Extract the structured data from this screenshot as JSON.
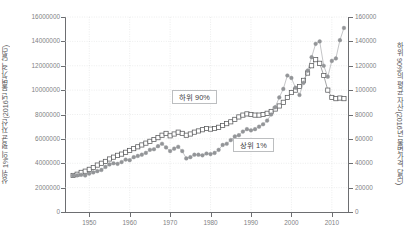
{
  "axes": {
    "left_title": "상위 1%의 평균 자산(2016년 불변가격 달러)",
    "right_title": "하위 90%의 평균 자산(2016년 불변가격 달러)",
    "x_title": "",
    "left_ticks": [
      "16000000",
      "14000000",
      "12000000",
      "10000000",
      "8000000",
      "6000000",
      "4000000",
      "2000000",
      "0"
    ],
    "right_ticks": [
      "160000",
      "140000",
      "120000",
      "100000",
      "80000",
      "60000",
      "40000",
      "20000",
      "0"
    ],
    "x_ticks": [
      "1950",
      "1960",
      "1970",
      "1980",
      "1990",
      "2000",
      "2010"
    ]
  },
  "labels": {
    "bottom90": "하위 90%",
    "top1": "상위 1%"
  },
  "colors": {
    "axis": "#6d6e71",
    "grid": "#d9dadb",
    "series_bottom90": "#58595b",
    "series_top1": "#939598",
    "text": "#808184",
    "title_text": "#58585a",
    "label_border": "#bcbec0",
    "background": "#ffffff"
  },
  "chart_data": {
    "type": "line",
    "title": "",
    "xlabel": "",
    "ylabel": "상위 1%의 평균 자산(2016년 불변가격 달러)",
    "y2label": "하위 90%의 평균 자산(2016년 불변가격 달러)",
    "xlim": [
      1944,
      2014
    ],
    "ylim": [
      0,
      16000000
    ],
    "y2lim": [
      0,
      160000
    ],
    "grid": true,
    "legend_position": "inside-plot",
    "x": [
      1946,
      1947,
      1948,
      1949,
      1950,
      1951,
      1952,
      1953,
      1954,
      1955,
      1956,
      1957,
      1958,
      1959,
      1960,
      1961,
      1962,
      1963,
      1964,
      1965,
      1966,
      1967,
      1968,
      1969,
      1970,
      1971,
      1972,
      1973,
      1974,
      1975,
      1976,
      1977,
      1978,
      1979,
      1980,
      1981,
      1982,
      1983,
      1984,
      1985,
      1986,
      1987,
      1988,
      1989,
      1990,
      1991,
      1992,
      1993,
      1994,
      1995,
      1996,
      1997,
      1998,
      1999,
      2000,
      2001,
      2002,
      2003,
      2004,
      2005,
      2006,
      2007,
      2008,
      2009,
      2010,
      2011,
      2012,
      2013
    ],
    "series": [
      {
        "name": "하위 90%",
        "axis": "right",
        "marker": "open-square",
        "values": [
          30000,
          31000,
          32500,
          33500,
          35000,
          36500,
          38500,
          40000,
          41500,
          43500,
          45000,
          46500,
          47500,
          49000,
          50500,
          52000,
          53500,
          55000,
          56500,
          58000,
          59500,
          61000,
          63000,
          64500,
          62500,
          64000,
          65500,
          64500,
          63000,
          64000,
          65500,
          66500,
          67500,
          68500,
          68000,
          68500,
          69500,
          71000,
          72500,
          74000,
          76000,
          78000,
          79500,
          80500,
          80000,
          79500,
          79500,
          80000,
          81000,
          82500,
          84500,
          87000,
          90000,
          94000,
          98000,
          100000,
          103000,
          108000,
          114000,
          120000,
          125000,
          122000,
          112000,
          100000,
          94000,
          93000,
          93500,
          93000
        ]
      },
      {
        "name": "상위 1%",
        "axis": "left",
        "marker": "filled-circle",
        "values": [
          3000000,
          3000000,
          3050000,
          3000000,
          3150000,
          3250000,
          3350000,
          3450000,
          3700000,
          3900000,
          4000000,
          3950000,
          4100000,
          4300000,
          4250000,
          4500000,
          4600000,
          4700000,
          4850000,
          5100000,
          5150000,
          5400000,
          5600000,
          5300000,
          5000000,
          5200000,
          5350000,
          5000000,
          4400000,
          4500000,
          4700000,
          4700000,
          4650000,
          4800000,
          4750000,
          4850000,
          5100000,
          5500000,
          5600000,
          5900000,
          6200000,
          6300000,
          6600000,
          6800000,
          6700000,
          6800000,
          7000000,
          7200000,
          7500000,
          8000000,
          8600000,
          9400000,
          10100000,
          11200000,
          11000000,
          10200000,
          9600000,
          10600000,
          11600000,
          12700000,
          13800000,
          14000000,
          12000000,
          11100000,
          12400000,
          12600000,
          14100000,
          15100000
        ]
      }
    ]
  }
}
